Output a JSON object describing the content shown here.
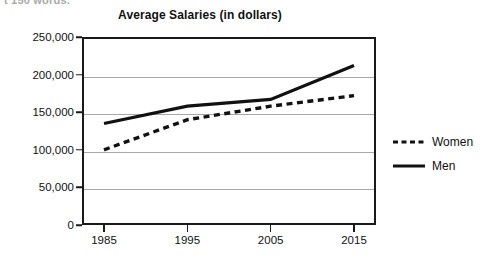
{
  "clipped_header_text": "t 150 words.",
  "chart_data": {
    "type": "line",
    "title": "Average Salaries (in dollars)",
    "xlabel": "",
    "ylabel": "",
    "x": [
      "1985",
      "1995",
      "2005",
      "2015"
    ],
    "categories": [
      "1985",
      "1995",
      "2005",
      "2015"
    ],
    "series": [
      {
        "name": "Women",
        "style": "dashed",
        "color": "#111111",
        "values": [
          100000,
          140000,
          158000,
          172000
        ]
      },
      {
        "name": "Men",
        "style": "solid",
        "color": "#111111",
        "values": [
          135000,
          158000,
          167000,
          212000
        ]
      }
    ],
    "ylim": [
      0,
      250000
    ],
    "y_ticks": [
      250000,
      200000,
      150000,
      100000,
      50000,
      0
    ],
    "y_tick_labels": [
      "250,000",
      "200,000",
      "150,000",
      "100,000",
      "50,000",
      "0"
    ],
    "x_tick_labels": [
      "1985",
      "1995",
      "2005",
      "2015"
    ],
    "grid": true,
    "grid_axis": "y",
    "legend_position": "right",
    "legend": [
      "Women",
      "Men"
    ]
  },
  "legend": {
    "items": [
      {
        "label": "Women",
        "swatch": "dashed-line-swatch"
      },
      {
        "label": "Men",
        "swatch": "solid-line-swatch"
      }
    ]
  }
}
